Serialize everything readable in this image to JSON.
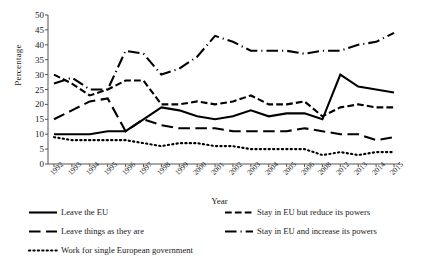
{
  "chart_data": {
    "type": "line",
    "title": "",
    "xlabel": "Year",
    "ylabel": "Percentage",
    "ylim": [
      0,
      50
    ],
    "ytick_step": 5,
    "yticks": [
      0,
      5,
      10,
      15,
      20,
      25,
      30,
      35,
      40,
      45,
      50
    ],
    "grid": false,
    "legend_position": "bottom",
    "categories": [
      "1992",
      "1993",
      "1994",
      "1995",
      "1996",
      "1997",
      "1998",
      "1999",
      "2000",
      "2001",
      "2002",
      "2003",
      "2004",
      "2005",
      "2006",
      "2008",
      "2012",
      "2013",
      "2014",
      "2015"
    ],
    "series": [
      {
        "name": "Leave the EU",
        "style": "solid",
        "color": "#000000",
        "width": 2.1,
        "values": [
          10,
          10,
          10,
          11,
          11,
          15,
          19,
          18,
          16,
          15,
          16,
          18,
          16,
          17,
          17,
          15,
          30,
          26,
          25,
          24
        ]
      },
      {
        "name": "Stay in EU but reduce its powers",
        "style": "dash-medium",
        "color": "#000000",
        "width": 2.1,
        "values": [
          30,
          27,
          23,
          25,
          28,
          28,
          20,
          20,
          21,
          20,
          21,
          23,
          20,
          20,
          21,
          16,
          19,
          20,
          19,
          19
        ]
      },
      {
        "name": "Leave things as they are",
        "style": "dash-long",
        "color": "#000000",
        "width": 2.1,
        "values": [
          15,
          18,
          21,
          22,
          11,
          15,
          13,
          12,
          12,
          12,
          11,
          11,
          11,
          11,
          12,
          11,
          10,
          10,
          8,
          9
        ]
      },
      {
        "name": "Stay in EU and increase its powers",
        "style": "dash-dot",
        "color": "#000000",
        "width": 2.1,
        "values": [
          27,
          29,
          25,
          25,
          38,
          37,
          30,
          32,
          36,
          43,
          41,
          38,
          38,
          38,
          37,
          38,
          38,
          40,
          41,
          44
        ]
      },
      {
        "name": "Work for single European government",
        "style": "dotted",
        "color": "#000000",
        "width": 2.1,
        "values": [
          9,
          8,
          8,
          8,
          8,
          7,
          6,
          7,
          7,
          6,
          6,
          5,
          5,
          5,
          5,
          3,
          4,
          3,
          4,
          4
        ]
      }
    ]
  },
  "legend": {
    "rows": [
      {
        "left": "Leave the EU",
        "left_style": "solid",
        "right": "Stay in EU but reduce its powers",
        "right_style": "dash-medium"
      },
      {
        "left": "Leave things as they are",
        "left_style": "dash-long",
        "right": "Stay in EU and increase its powers",
        "right_style": "dash-dot"
      },
      {
        "left": "Work for single European government",
        "left_style": "dotted",
        "right": "",
        "right_style": ""
      }
    ]
  }
}
